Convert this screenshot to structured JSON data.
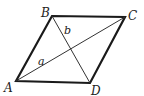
{
  "diagram": {
    "type": "parallelogram-with-diagonals",
    "stroke_color": "#1a1a1a",
    "vertices": {
      "A": {
        "label": "A",
        "x": 16,
        "y": 81
      },
      "B": {
        "label": "B",
        "x": 52,
        "y": 16
      },
      "C": {
        "label": "C",
        "x": 125,
        "y": 17
      },
      "D": {
        "label": "D",
        "x": 90,
        "y": 83
      }
    },
    "diagonals": {
      "a": {
        "label": "a",
        "from": "A",
        "to": "C"
      },
      "b": {
        "label": "b",
        "from": "B",
        "to": "D"
      }
    }
  }
}
